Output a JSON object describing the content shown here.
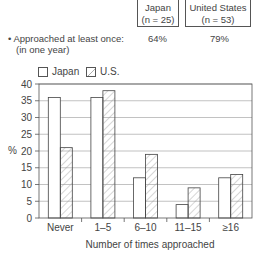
{
  "header": {
    "columns": [
      {
        "name": "Japan",
        "n": "(n = 25)"
      },
      {
        "name": "United States",
        "n": "(n = 53)"
      }
    ],
    "stat_label_line1": "• Approached at least once:",
    "stat_label_line2": "(in one year)",
    "stat_values": [
      "64%",
      "79%"
    ]
  },
  "chart_data": {
    "type": "bar",
    "title": "",
    "xlabel": "Number of times approached",
    "ylabel": "%",
    "ylim": [
      0,
      40
    ],
    "yticks": [
      0,
      5,
      10,
      15,
      20,
      25,
      30,
      35,
      40
    ],
    "grid": true,
    "legend_position": "top-left",
    "categories": [
      "Never",
      "1–5",
      "6–10",
      "11–15",
      "≥16"
    ],
    "series": [
      {
        "name": "Japan",
        "pattern": "plain",
        "values": [
          36,
          36,
          12,
          4,
          12
        ]
      },
      {
        "name": "U.S.",
        "pattern": "hatched",
        "values": [
          21,
          38,
          19,
          9,
          13
        ]
      }
    ]
  }
}
